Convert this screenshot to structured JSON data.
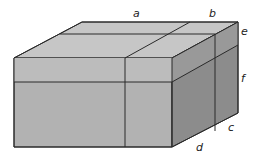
{
  "diagram": {
    "type": "3d-box",
    "labels": {
      "a": "a",
      "b": "b",
      "c": "c",
      "d": "d",
      "e": "e",
      "f": "f"
    },
    "colors": {
      "top": "#c4c4c4",
      "front": "#b3b3b3",
      "right": "#8e8e8e",
      "edge": "#2a2a2a"
    }
  }
}
